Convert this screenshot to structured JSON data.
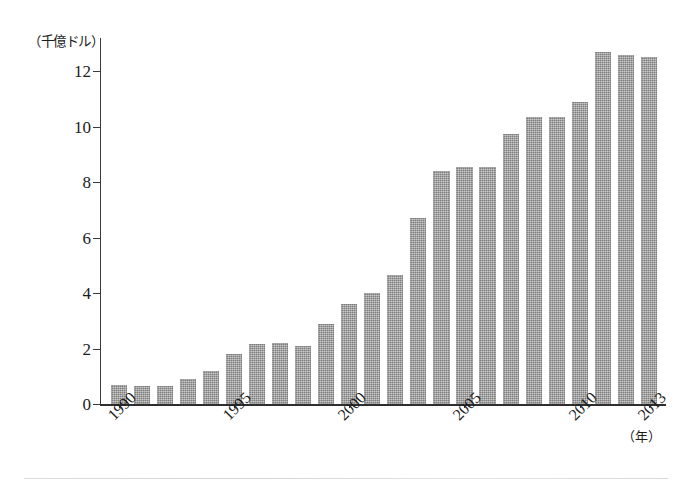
{
  "figure": {
    "y_axis_unit": "（千億ドル）",
    "x_axis_unit": "（年）",
    "background_color": "#ffffff",
    "bar_color": "#8d8d8d",
    "axis_color": "#3a3a3a"
  },
  "chart_data": {
    "type": "bar",
    "title": "",
    "subtitle": "",
    "xlabel": "（年）",
    "ylabel": "（千億ドル）",
    "ylim": [
      0,
      13.2
    ],
    "yticks": [
      0,
      2,
      4,
      6,
      8,
      10,
      12
    ],
    "ytick_labels": [
      "0",
      "2",
      "4",
      "6",
      "8",
      "10",
      "12"
    ],
    "xtick_labels": [
      "1990",
      "1995",
      "2000",
      "2005",
      "2010",
      "2013"
    ],
    "xtick_categories": [
      "1990",
      "1995",
      "2000",
      "2005",
      "2010",
      "2013"
    ],
    "grid": false,
    "legend": null,
    "legend_position": "none",
    "annotations": [],
    "categories": [
      "1990",
      "1991",
      "1992",
      "1993",
      "1994",
      "1995",
      "1996",
      "1997",
      "1998",
      "1999",
      "2000",
      "2001",
      "2002",
      "2003",
      "2004",
      "2005",
      "2006",
      "2007",
      "2008",
      "2009",
      "2010",
      "2011",
      "2012",
      "2013"
    ],
    "values": [
      0.7,
      0.65,
      0.65,
      0.9,
      1.2,
      1.8,
      2.15,
      2.2,
      2.1,
      2.9,
      3.6,
      4.0,
      4.65,
      6.7,
      8.4,
      8.55,
      8.55,
      9.75,
      10.35,
      10.35,
      10.9,
      12.7,
      12.6,
      12.5
    ]
  }
}
